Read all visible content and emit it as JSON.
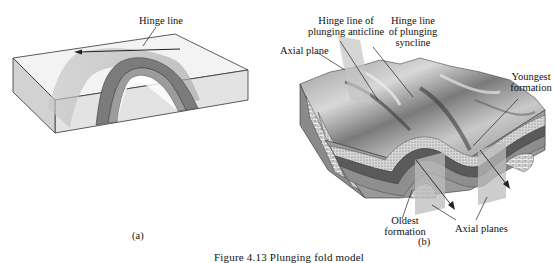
{
  "figure": {
    "caption": "Figure 4.13   Plunging fold model",
    "panel_a": {
      "sublabel": "(a)",
      "labels": {
        "hinge_line": "Hinge line"
      }
    },
    "panel_b": {
      "sublabel": "(b)",
      "labels": {
        "hinge_anticline_1": "Hinge line of",
        "hinge_anticline_2": "plunging anticline",
        "hinge_syncline_1": "Hinge line",
        "hinge_syncline_2": "of plunging",
        "hinge_syncline_3": "syncline",
        "axial_plane": "Axial plane",
        "youngest_1": "Youngest",
        "youngest_2": "formation",
        "oldest_1": "Oldest",
        "oldest_2": "formation",
        "axial_planes": "Axial planes"
      }
    },
    "colors": {
      "block_top": "#f2f2f2",
      "block_side": "#d9d9d9",
      "layer_dark": "#5a5a5a",
      "layer_mid": "#8c8c8c",
      "plane_shade": "#b8b8b8",
      "outline": "#333333"
    }
  }
}
